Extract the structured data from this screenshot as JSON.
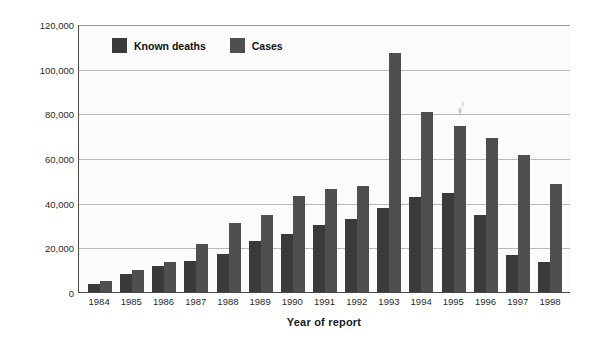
{
  "chart_data": {
    "type": "bar",
    "title": "",
    "xlabel": "Year of report",
    "ylabel": "Reported cases",
    "categories": [
      "1984",
      "1985",
      "1986",
      "1987",
      "1988",
      "1989",
      "1990",
      "1991",
      "1992",
      "1993",
      "1994",
      "1995",
      "1996",
      "1997",
      "1998"
    ],
    "series": [
      {
        "name": "Known deaths",
        "color": "#3a3a3a",
        "values": [
          3500,
          8000,
          11500,
          14000,
          17000,
          23000,
          26000,
          30000,
          32500,
          37500,
          42500,
          44500,
          34500,
          16500,
          13500
        ]
      },
      {
        "name": "Cases",
        "color": "#4f4f4f",
        "values": [
          5000,
          10000,
          13500,
          21500,
          31000,
          34500,
          43000,
          46000,
          47500,
          107000,
          80500,
          74500,
          69000,
          61500,
          48500
        ]
      }
    ],
    "ylim": [
      0,
      120000
    ],
    "ytick_values": [
      0,
      20000,
      40000,
      60000,
      80000,
      100000,
      120000
    ],
    "ytick_labels": [
      "0",
      "20,000",
      "40,000",
      "60,000",
      "80,000",
      "100,000",
      "120,000"
    ],
    "grid": true,
    "legend_position": "top-left-inside"
  },
  "legend": {
    "items": [
      {
        "label": "Known deaths",
        "swatch": "legend-swatch-known-deaths"
      },
      {
        "label": "Cases",
        "swatch": "legend-swatch-cases"
      }
    ]
  },
  "axes": {
    "x_title": "Year of report",
    "y_title": "Reported cases"
  }
}
